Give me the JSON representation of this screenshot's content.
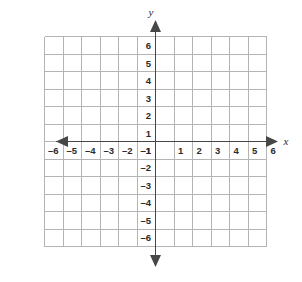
{
  "figure": {
    "kind": "cartesian-coordinate-plane",
    "background_color": "#ffffff",
    "grid_color": "#b4b4b4",
    "axis_color": "#474747",
    "label_color": "#2b2b2b"
  },
  "axes": {
    "x_name": "x",
    "y_name": "y",
    "x_name_position": "right-of-positive-arrow",
    "y_name_position": "above-positive-arrow",
    "arrowheads": [
      "left",
      "right",
      "up",
      "down"
    ]
  },
  "chart_data": {
    "type": "scatter",
    "title": "",
    "subtitle": "",
    "xlabel": "x",
    "ylabel": "y",
    "grid": true,
    "grid_step": 1,
    "legend": false,
    "legend_position": "none",
    "xlim": [
      -6,
      6
    ],
    "ylim": [
      -6,
      6
    ],
    "x_ticks": [
      -6,
      -5,
      -4,
      -3,
      -2,
      -1,
      1,
      2,
      3,
      4,
      5,
      6
    ],
    "y_ticks": [
      -6,
      -5,
      -4,
      -3,
      -2,
      -1,
      1,
      2,
      3,
      4,
      5,
      6
    ],
    "x_tick_labels": [
      "–6",
      "–5",
      "–4",
      "–3",
      "–2",
      "–1",
      "1",
      "2",
      "3",
      "4",
      "5",
      "6"
    ],
    "y_tick_labels": [
      "–6",
      "–5",
      "–4",
      "–3",
      "–2",
      "–1",
      "1",
      "2",
      "3",
      "4",
      "5",
      "6"
    ],
    "origin_label": "",
    "series": [],
    "annotations": [],
    "points": []
  }
}
